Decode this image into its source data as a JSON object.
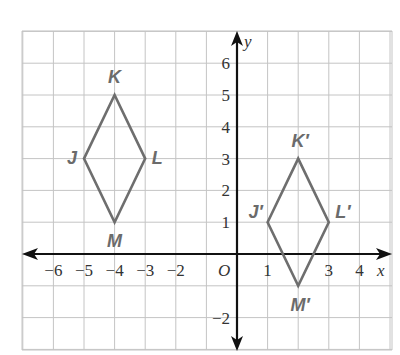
{
  "chart_data": {
    "type": "coordinate-plane",
    "title": "",
    "xlabel": "x",
    "ylabel": "y",
    "origin_label": "O",
    "xlim": [
      -7,
      5
    ],
    "ylim": [
      -3,
      7
    ],
    "grid": true,
    "x_tick_labels": [
      {
        "value": -6,
        "label": "−6"
      },
      {
        "value": -5,
        "label": "−5"
      },
      {
        "value": -4,
        "label": "−4"
      },
      {
        "value": -3,
        "label": "−3"
      },
      {
        "value": -2,
        "label": "−2"
      },
      {
        "value": 1,
        "label": "1"
      },
      {
        "value": 3,
        "label": "3"
      },
      {
        "value": 4,
        "label": "4"
      }
    ],
    "y_tick_labels": [
      {
        "value": 6,
        "label": "6"
      },
      {
        "value": 5,
        "label": "5"
      },
      {
        "value": 4,
        "label": "4"
      },
      {
        "value": 3,
        "label": "3"
      },
      {
        "value": 2,
        "label": "2"
      },
      {
        "value": 1,
        "label": "1"
      },
      {
        "value": -2,
        "label": "−2"
      }
    ],
    "shapes": [
      {
        "name": "JKLM",
        "points": [
          {
            "label": "J",
            "x": -5,
            "y": 3
          },
          {
            "label": "K",
            "x": -4,
            "y": 5
          },
          {
            "label": "L",
            "x": -3,
            "y": 3
          },
          {
            "label": "M",
            "x": -4,
            "y": 1
          }
        ]
      },
      {
        "name": "J'K'L'M'",
        "points": [
          {
            "label": "J′",
            "x": 1,
            "y": 1
          },
          {
            "label": "K′",
            "x": 2,
            "y": 3
          },
          {
            "label": "L′",
            "x": 3,
            "y": 1
          },
          {
            "label": "M′",
            "x": 2,
            "y": -1
          }
        ]
      }
    ],
    "colors": {
      "shape_stroke": "#6e6e6e",
      "grid": "#c4c4c4",
      "axis": "#111111"
    }
  }
}
